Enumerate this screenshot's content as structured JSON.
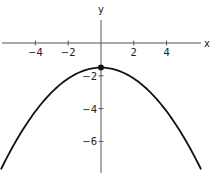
{
  "chart_data": {
    "type": "line",
    "title": "",
    "xlabel": "x",
    "ylabel": "y",
    "function": "y = -x^2/6 - 1.5",
    "xlim": [
      -6.1,
      6.4
    ],
    "ylim": [
      -7.9,
      2.6
    ],
    "x_ticks": [
      -4,
      -2,
      2,
      4
    ],
    "y_ticks": [
      -2,
      -4,
      -6
    ],
    "x_tick_labels": [
      "-4",
      "-2",
      "2",
      "4"
    ],
    "y_tick_labels": [
      "-2",
      "-4",
      "-6"
    ],
    "grid": false,
    "vertex": {
      "x": 0,
      "y": -1.5,
      "marked": true
    },
    "series": [
      {
        "name": "parabola",
        "x": [
          -6,
          -5,
          -4,
          -3,
          -2,
          -1,
          0,
          1,
          2,
          3,
          4,
          5,
          6
        ],
        "y": [
          -7.5,
          -5.67,
          -4.17,
          -3.0,
          -2.17,
          -1.67,
          -1.5,
          -1.67,
          -2.17,
          -3.0,
          -4.17,
          -5.67,
          -7.5
        ]
      }
    ],
    "colors": {
      "curve": "#111111",
      "axes": "#555555"
    }
  }
}
